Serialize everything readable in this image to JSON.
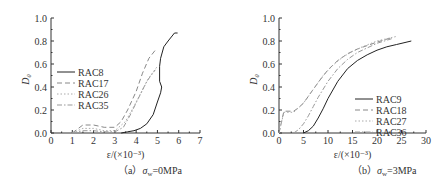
{
  "chart_data": [
    {
      "type": "line",
      "panel": "a",
      "caption": "（a） σw=0MPa",
      "caption_prefix": "（a）",
      "caption_sigma": "σ",
      "caption_sub": "w",
      "caption_rest": "=0MPa",
      "xlabel": "ε/(×10⁻³)",
      "ylabel": "D₀",
      "xlim": [
        0,
        7
      ],
      "ylim": [
        0,
        1.0
      ],
      "xticks": [
        "0",
        "1",
        "2",
        "3",
        "4",
        "5",
        "6",
        "7"
      ],
      "yticks": [
        "0.0",
        "0.2",
        "0.4",
        "0.6",
        "0.8",
        "1.0"
      ],
      "legend_position": "left-middle",
      "series": [
        {
          "name": "RAC8",
          "style": "solid",
          "color": "#222222",
          "x": [
            3.3,
            3.6,
            3.9,
            4.2,
            4.5,
            4.8,
            5.0,
            5.15,
            5.2,
            5.1,
            5.1,
            5.15,
            5.3,
            5.5,
            5.8,
            5.95
          ],
          "y": [
            0.0,
            0.01,
            0.02,
            0.04,
            0.08,
            0.16,
            0.27,
            0.35,
            0.4,
            0.45,
            0.58,
            0.65,
            0.75,
            0.8,
            0.87,
            0.87
          ]
        },
        {
          "name": "RAC17",
          "style": "dashed",
          "color": "#888888",
          "x": [
            1.0,
            1.5,
            2.0,
            2.5,
            3.0,
            3.3,
            3.6,
            4.0,
            4.3,
            4.6,
            4.9
          ],
          "y": [
            0.0,
            0.07,
            0.07,
            0.05,
            0.05,
            0.1,
            0.2,
            0.36,
            0.52,
            0.65,
            0.72
          ]
        },
        {
          "name": "RAC26",
          "style": "dotted",
          "color": "#aaaaaa",
          "x": [
            1.0,
            1.5,
            2.0,
            2.5,
            3.0,
            3.5,
            3.8,
            4.2,
            4.6,
            5.0
          ],
          "y": [
            0.0,
            0.04,
            0.04,
            0.02,
            0.02,
            0.1,
            0.2,
            0.34,
            0.48,
            0.58
          ]
        },
        {
          "name": "RAC35",
          "style": "dashdot",
          "color": "#999999",
          "x": [
            1.0,
            1.5,
            2.0,
            2.5,
            3.0,
            3.4,
            3.7,
            4.1,
            4.5,
            4.9
          ],
          "y": [
            0.0,
            0.02,
            0.02,
            0.01,
            0.01,
            0.05,
            0.15,
            0.3,
            0.45,
            0.55
          ]
        }
      ]
    },
    {
      "type": "line",
      "panel": "b",
      "caption": "（b） σw=3MPa",
      "caption_prefix": "（b）",
      "caption_sigma": "σ",
      "caption_sub": "w",
      "caption_rest": "=3MPa",
      "xlabel": "ε/(×10⁻³)",
      "ylabel": "D₀",
      "xlim": [
        0,
        30
      ],
      "ylim": [
        0,
        1.0
      ],
      "xticks": [
        "0",
        "5",
        "10",
        "15",
        "20",
        "25",
        "30"
      ],
      "yticks": [
        "0.0",
        "0.2",
        "0.4",
        "0.6",
        "0.8",
        "1.0"
      ],
      "legend_position": "lower-right",
      "series": [
        {
          "name": "RAC9",
          "style": "solid",
          "color": "#222222",
          "x": [
            5,
            6,
            7,
            8,
            9,
            10,
            12,
            14,
            16,
            18,
            20,
            22,
            24,
            27
          ],
          "y": [
            0.0,
            0.02,
            0.06,
            0.13,
            0.21,
            0.3,
            0.45,
            0.56,
            0.63,
            0.68,
            0.72,
            0.75,
            0.77,
            0.8
          ]
        },
        {
          "name": "RAC18",
          "style": "dashed",
          "color": "#888888",
          "x": [
            0,
            1,
            3,
            4,
            5,
            6,
            8,
            10,
            12,
            14,
            16,
            18,
            20,
            23
          ],
          "y": [
            0.0,
            0.19,
            0.19,
            0.22,
            0.26,
            0.32,
            0.44,
            0.55,
            0.63,
            0.69,
            0.73,
            0.76,
            0.79,
            0.83
          ]
        },
        {
          "name": "RAC27",
          "style": "dotted",
          "color": "#aaaaaa",
          "x": [
            0,
            1,
            3,
            5,
            7,
            9,
            11,
            13,
            15,
            17,
            20,
            24
          ],
          "y": [
            0.0,
            0.18,
            0.18,
            0.26,
            0.38,
            0.5,
            0.59,
            0.66,
            0.71,
            0.75,
            0.8,
            0.84
          ]
        },
        {
          "name": "RAC36",
          "style": "dashdot",
          "color": "#999999",
          "x": [
            3,
            4,
            5,
            6,
            7,
            8,
            10,
            12,
            14,
            16,
            18,
            20,
            23
          ],
          "y": [
            0.0,
            0.03,
            0.08,
            0.15,
            0.23,
            0.31,
            0.45,
            0.56,
            0.64,
            0.7,
            0.74,
            0.78,
            0.82
          ]
        }
      ]
    }
  ]
}
